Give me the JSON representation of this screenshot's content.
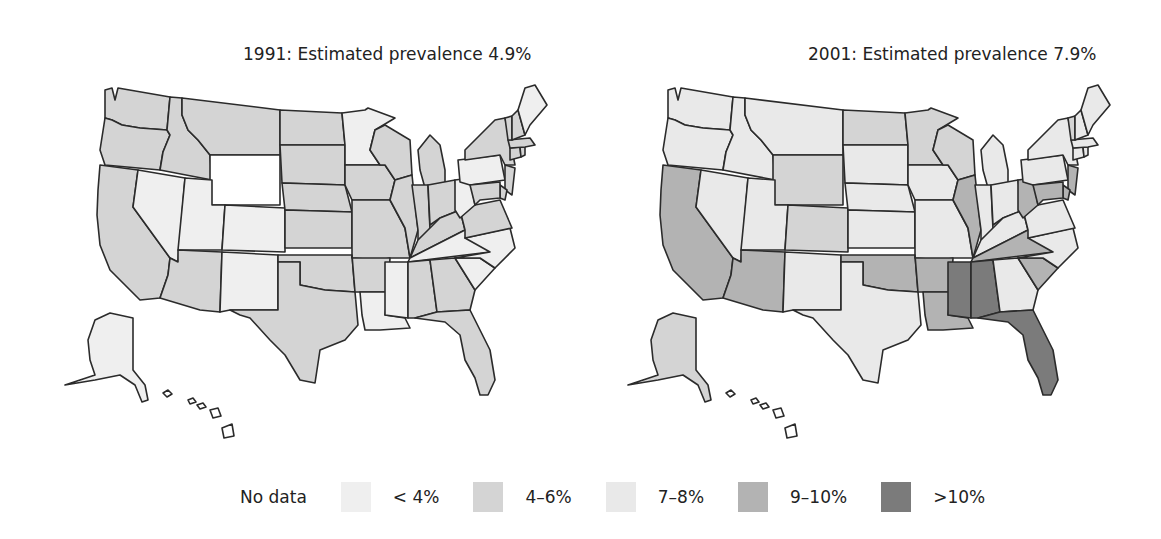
{
  "figure": {
    "panels": [
      {
        "id": "1991",
        "title": "1991: Estimated prevalence 4.9%"
      },
      {
        "id": "2001",
        "title": "2001: Estimated prevalence 7.9%"
      }
    ],
    "legend": [
      {
        "key": "nodata",
        "label": "No data",
        "color": "#ffffff"
      },
      {
        "key": "lt4",
        "label": "< 4%",
        "color": "#efefef"
      },
      {
        "key": "4to6",
        "label": "4–6%",
        "color": "#d4d4d4"
      },
      {
        "key": "7to8",
        "label": "7–8%",
        "color": "#e9e9e9"
      },
      {
        "key": "9to10",
        "label": "9–10%",
        "color": "#b3b3b3"
      },
      {
        "key": "gt10",
        "label": ">10%",
        "color": "#7b7b7b"
      }
    ]
  },
  "chart_data": {
    "type": "choropleth",
    "legend_position": "bottom",
    "categories": [
      "No data",
      "< 4%",
      "4–6%",
      "7–8%",
      "9–10%",
      ">10%"
    ],
    "series": [
      {
        "name": "1991",
        "overall_prevalence": "4.9%",
        "values": {
          "WA": "4–6%",
          "OR": "4–6%",
          "CA": "4–6%",
          "ID": "4–6%",
          "MT": "4–6%",
          "WY": "No data",
          "NV": "< 4%",
          "UT": "< 4%",
          "CO": "< 4%",
          "AZ": "4–6%",
          "NM": "< 4%",
          "ND": "4–6%",
          "SD": "4–6%",
          "NE": "4–6%",
          "KS": "4–6%",
          "OK": "4–6%",
          "TX": "4–6%",
          "MN": "< 4%",
          "IA": "4–6%",
          "MO": "4–6%",
          "AR": "4–6%",
          "LA": "< 4%",
          "WI": "4–6%",
          "IL": "4–6%",
          "MI": "4–6%",
          "IN": "4–6%",
          "OH": "4–6%",
          "KY": "4–6%",
          "TN": "< 4%",
          "MS": "< 4%",
          "AL": "4–6%",
          "GA": "4–6%",
          "FL": "4–6%",
          "SC": "< 4%",
          "NC": "< 4%",
          "VA": "4–6%",
          "WV": "< 4%",
          "PA": "< 4%",
          "NY": "4–6%",
          "NJ": "4–6%",
          "DE": "4–6%",
          "MD": "4–6%",
          "CT": "4–6%",
          "RI": "4–6%",
          "MA": "4–6%",
          "VT": "4–6%",
          "NH": "4–6%",
          "ME": "< 4%",
          "AK": "< 4%",
          "HI": "No data"
        }
      },
      {
        "name": "2001",
        "overall_prevalence": "7.9%",
        "values": {
          "WA": "7–8%",
          "OR": "7–8%",
          "CA": "9–10%",
          "ID": "7–8%",
          "MT": "7–8%",
          "WY": "4–6%",
          "NV": "7–8%",
          "UT": "7–8%",
          "CO": "4–6%",
          "AZ": "9–10%",
          "NM": "7–8%",
          "ND": "4–6%",
          "SD": "7–8%",
          "NE": "7–8%",
          "KS": "7–8%",
          "OK": "9–10%",
          "TX": "7–8%",
          "MN": "4–6%",
          "IA": "7–8%",
          "MO": "7–8%",
          "AR": "9–10%",
          "LA": "9–10%",
          "WI": "4–6%",
          "IL": "9–10%",
          "MI": "7–8%",
          "IN": "7–8%",
          "OH": "7–8%",
          "KY": "7–8%",
          "TN": "9–10%",
          "MS": ">10%",
          "AL": ">10%",
          "GA": "7–8%",
          "FL": ">10%",
          "SC": "9–10%",
          "NC": "7–8%",
          "VA": "7–8%",
          "WV": "9–10%",
          "PA": "7–8%",
          "NY": "7–8%",
          "NJ": "9–10%",
          "DE": "9–10%",
          "MD": "9–10%",
          "CT": "7–8%",
          "RI": "7–8%",
          "MA": "7–8%",
          "VT": "4–6%",
          "NH": "7–8%",
          "ME": "7–8%",
          "AK": "4–6%",
          "HI": "No data"
        }
      }
    ]
  }
}
